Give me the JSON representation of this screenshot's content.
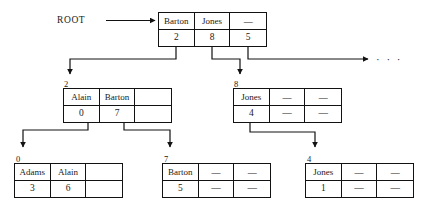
{
  "diagram": {
    "root_label": "ROOT",
    "ellipsis": "· · ·",
    "dash_symbol": "—",
    "colors": {
      "ink": "#121212",
      "background": "#ffffff"
    }
  },
  "nodes": {
    "root": {
      "id": "root",
      "tag": "",
      "keys": [
        "Barton",
        "Jones",
        "—"
      ],
      "pointers": [
        "2",
        "8",
        "5"
      ]
    },
    "n2": {
      "id": "n2",
      "tag": "2",
      "keys": [
        "Alain",
        "Barton",
        ""
      ],
      "pointers": [
        "0",
        "7",
        ""
      ]
    },
    "n8": {
      "id": "n8",
      "tag": "8",
      "keys": [
        "Jones",
        "—",
        "—"
      ],
      "pointers": [
        "4",
        "—",
        "—"
      ]
    },
    "n0": {
      "id": "n0",
      "tag": "0",
      "keys": [
        "Adams",
        "Alain",
        ""
      ],
      "pointers": [
        "3",
        "6",
        ""
      ]
    },
    "n7": {
      "id": "n7",
      "tag": "7",
      "keys": [
        "Barton",
        "—",
        "—"
      ],
      "pointers": [
        "5",
        "—",
        "—"
      ]
    },
    "n4": {
      "id": "n4",
      "tag": "4",
      "keys": [
        "Jones",
        "—",
        "—"
      ],
      "pointers": [
        "1",
        "—",
        "—"
      ]
    }
  }
}
